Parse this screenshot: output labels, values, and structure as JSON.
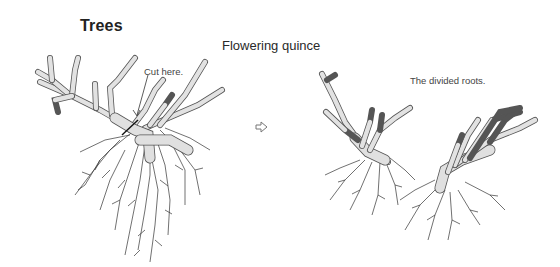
{
  "page": {
    "title": "Trees",
    "subtitle": "Flowering quince"
  },
  "illustrations": {
    "before": {
      "label": "Cut here.",
      "description": "Flowering quince shrub with roots, showing cut point"
    },
    "transition": {
      "icon": "arrow-right-icon"
    },
    "after": {
      "label": "The divided roots.",
      "description": "Two divided plants with separate roots"
    }
  },
  "colors": {
    "branch_fill": "#e2e2e2",
    "branch_stroke": "#555555",
    "root_stroke": "#333333",
    "text": "#222222"
  }
}
